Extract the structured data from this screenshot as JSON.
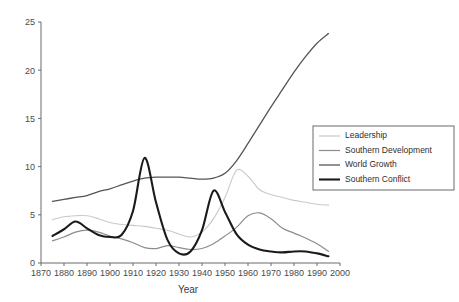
{
  "chart_data": {
    "type": "line",
    "title": "",
    "xlabel": "Year",
    "ylabel": "",
    "xlim": [
      1870,
      2000
    ],
    "ylim": [
      0,
      25
    ],
    "grid": false,
    "legend_position": "right-middle",
    "x_ticks": [
      1870,
      1880,
      1890,
      1900,
      1910,
      1920,
      1930,
      1940,
      1950,
      1960,
      1970,
      1980,
      1990,
      2000
    ],
    "y_ticks": [
      0,
      5,
      10,
      15,
      20,
      25
    ],
    "x": [
      1875,
      1880,
      1885,
      1890,
      1895,
      1900,
      1905,
      1910,
      1915,
      1920,
      1925,
      1930,
      1935,
      1940,
      1945,
      1950,
      1955,
      1960,
      1965,
      1970,
      1975,
      1980,
      1985,
      1990,
      1995
    ],
    "series": [
      {
        "name": "Leadership",
        "color": "#c9c9c9",
        "width": 1.1,
        "values": [
          4.5,
          4.8,
          4.9,
          4.9,
          4.6,
          4.2,
          4.0,
          3.9,
          3.8,
          3.6,
          3.4,
          3.0,
          2.7,
          3.2,
          4.6,
          6.8,
          9.6,
          9.0,
          7.6,
          7.1,
          6.8,
          6.5,
          6.3,
          6.1,
          6.0
        ]
      },
      {
        "name": "Southern Development",
        "color": "#8c8c8c",
        "width": 1.2,
        "values": [
          2.3,
          2.7,
          3.2,
          3.4,
          3.2,
          2.8,
          2.5,
          2.1,
          1.6,
          1.5,
          1.8,
          1.6,
          1.4,
          1.5,
          2.0,
          2.8,
          3.7,
          4.9,
          5.2,
          4.6,
          3.6,
          3.1,
          2.6,
          2.0,
          1.2
        ]
      },
      {
        "name": "World Growth",
        "color": "#555555",
        "width": 1.3,
        "values": [
          6.4,
          6.6,
          6.8,
          7.0,
          7.4,
          7.7,
          8.1,
          8.5,
          8.8,
          8.9,
          8.9,
          8.9,
          8.8,
          8.7,
          8.8,
          9.3,
          10.6,
          12.4,
          14.3,
          16.2,
          18.0,
          19.8,
          21.4,
          22.8,
          23.8
        ]
      },
      {
        "name": "Southern Conflict",
        "color": "#1a1a1a",
        "width": 2.1,
        "values": [
          2.8,
          3.5,
          4.3,
          3.6,
          2.9,
          2.7,
          2.9,
          5.4,
          10.9,
          6.3,
          2.4,
          1.0,
          1.2,
          3.4,
          7.5,
          5.3,
          3.0,
          1.9,
          1.4,
          1.2,
          1.1,
          1.2,
          1.2,
          1.0,
          0.7
        ]
      }
    ]
  }
}
